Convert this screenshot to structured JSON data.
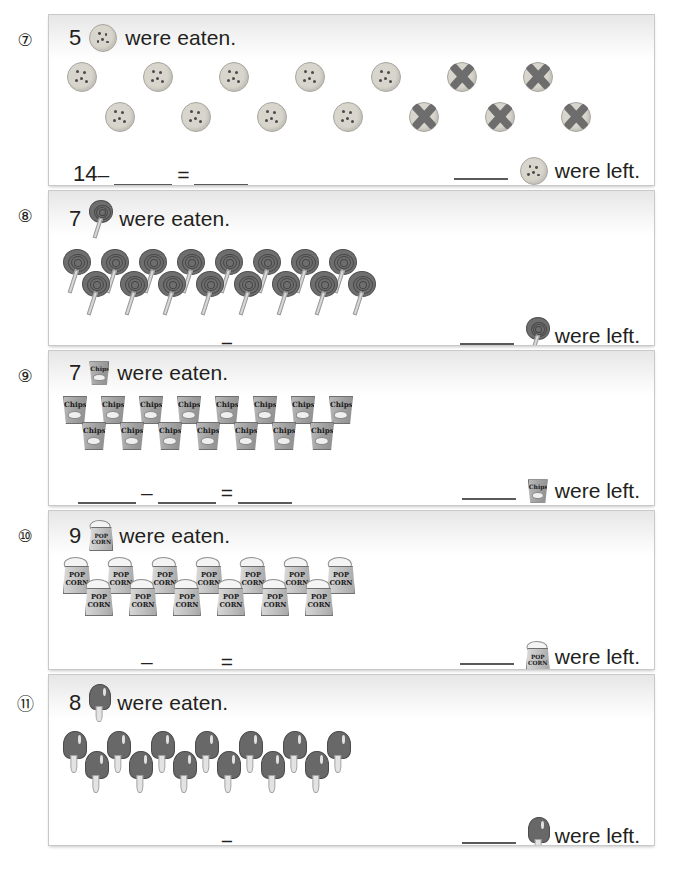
{
  "worksheet": {
    "phrase_eaten": "were eaten.",
    "phrase_left": "were left.",
    "minus": "–",
    "equals": "="
  },
  "problems": [
    {
      "number": "⑦",
      "eaten_count": "5",
      "icon": "cookie-icon",
      "icon_label": "cookie",
      "prompt_text": "were eaten.",
      "left_text": "were left.",
      "equation_lead": "14",
      "lead_is_blank": false,
      "total_items": 14,
      "crossed_out": 5,
      "top_row": 7,
      "bottom_row": 7,
      "top_crossed": 2,
      "bottom_crossed": 3
    },
    {
      "number": "⑧",
      "eaten_count": "7",
      "icon": "lollipop-icon",
      "icon_label": "lollipop",
      "prompt_text": "were eaten.",
      "left_text": "were left.",
      "equation_lead": "",
      "lead_is_blank": true,
      "total_items": 16,
      "crossed_out": 0,
      "top_row": 8,
      "bottom_row": 8,
      "top_crossed": 0,
      "bottom_crossed": 0
    },
    {
      "number": "⑨",
      "eaten_count": "7",
      "icon": "chips-icon",
      "icon_label": "Chips",
      "prompt_text": "were eaten.",
      "left_text": "were left.",
      "equation_lead": "",
      "lead_is_blank": true,
      "total_items": 15,
      "crossed_out": 0,
      "top_row": 8,
      "bottom_row": 7,
      "top_crossed": 0,
      "bottom_crossed": 0
    },
    {
      "number": "⑩",
      "eaten_count": "9",
      "icon": "popcorn-icon",
      "icon_label": "POP CORN",
      "prompt_text": "were eaten.",
      "left_text": "were left.",
      "equation_lead": "",
      "lead_is_blank": true,
      "total_items": 13,
      "crossed_out": 0,
      "top_row": 7,
      "bottom_row": 6,
      "top_crossed": 0,
      "bottom_crossed": 0
    },
    {
      "number": "⑪",
      "eaten_count": "8",
      "icon": "popsicle-icon",
      "icon_label": "popsicle",
      "prompt_text": "were eaten.",
      "left_text": "were left.",
      "equation_lead": "",
      "lead_is_blank": true,
      "total_items": 13,
      "crossed_out": 0,
      "top_row": 7,
      "bottom_row": 6,
      "top_crossed": 0,
      "bottom_crossed": 0
    }
  ],
  "colors": {
    "page_background": "#ffffff",
    "panel_border": "#c9c9c9",
    "panel_header_gradient_top": "#e6e6e6",
    "text": "#231f20",
    "blank_rule": "#5a5a5a",
    "cookie_body": "#d8d5cd",
    "cross_mark": "#6d6d6d",
    "lollipop_body": "#6e6e6e",
    "chips_bag": "#a5a5a5",
    "popcorn_box": "#c6c6c6",
    "popsicle_body": "#686868"
  }
}
